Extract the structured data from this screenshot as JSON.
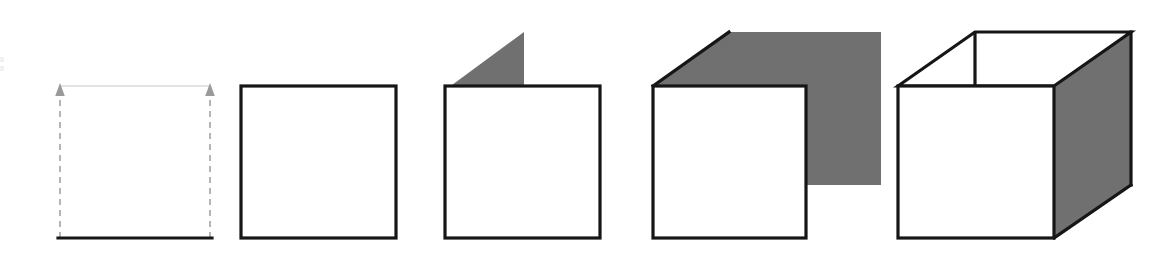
{
  "diagram": {
    "canvas": {
      "width": 1168,
      "height": 258,
      "background": "#ffffff"
    },
    "colors": {
      "outline": "#161616",
      "shaded_face": "#707070",
      "ghost_edge": "#e3e3e3",
      "dashed_guide": "#a8a8a8",
      "arrow_head": "#9a9a9a",
      "background": "#ffffff"
    },
    "steps": [
      {
        "index": 1,
        "name": "baseline-with-extrusion-arrows",
        "label": "Step 1",
        "caption": "Base edge with two upward extrusion arrows and dashed guides",
        "parts": [
          "solid-base-line",
          "left-dashed-arrow",
          "right-dashed-arrow",
          "ghost-top-edge"
        ]
      },
      {
        "index": 2,
        "name": "closed-square",
        "label": "Step 2",
        "caption": "Completed square front face",
        "parts": [
          "square-outline"
        ]
      },
      {
        "index": 3,
        "name": "square-with-small-flap",
        "label": "Step 3",
        "caption": "Square with a small shaded triangular flap beginning to sweep back",
        "parts": [
          "square-outline",
          "gray-triangle-flap"
        ]
      },
      {
        "index": 4,
        "name": "square-with-large-flap",
        "label": "Step 4",
        "caption": "Square with a large shaded side panel and top diagonal edge",
        "parts": [
          "square-outline",
          "gray-side-panel",
          "top-diagonal-edge"
        ]
      },
      {
        "index": 5,
        "name": "completed-cube",
        "label": "Step 5",
        "caption": "Finished cube with white front face, white top face and shaded right face",
        "parts": [
          "front-face",
          "top-face",
          "gray-right-face",
          "back-vertical-edge"
        ]
      }
    ],
    "geometry": {
      "front_face_top_y": 85,
      "front_face_bottom_y": 238,
      "depth_offset_x": 77,
      "depth_offset_y": 53
    }
  }
}
